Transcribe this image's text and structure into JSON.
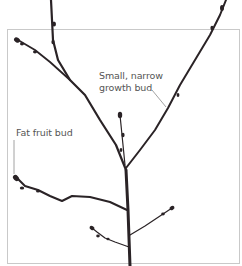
{
  "diagram": {
    "labels": {
      "growth_bud_line1": "Small, narrow",
      "growth_bud_line2": "growth bud",
      "fruit_bud": "Fat fruit bud"
    },
    "colors": {
      "branch": "#2a2326",
      "frame": "#c9c9c9",
      "label_text": "#555555",
      "leader_line": "#8a8a8a"
    }
  }
}
